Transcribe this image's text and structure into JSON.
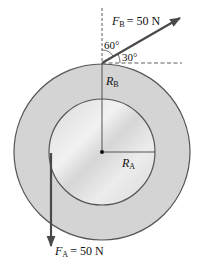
{
  "diagram": {
    "forces": {
      "FB": {
        "symbol": "F",
        "sub": "B",
        "value": "= 50 N",
        "angle_from_vertical": "60°",
        "angle_from_horizontal": "30°"
      },
      "FA": {
        "symbol": "F",
        "sub": "A",
        "value": "= 50 N"
      }
    },
    "radii": {
      "RB": {
        "symbol": "R",
        "sub": "B"
      },
      "RA": {
        "symbol": "R",
        "sub": "A"
      }
    },
    "colors": {
      "outer_disk": "#d4d4d4",
      "inner_disk": "#e2e2e2",
      "outline": "#555555",
      "arrow": "#4a4a4a"
    }
  }
}
